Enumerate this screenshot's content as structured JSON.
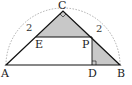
{
  "figure": {
    "points": {
      "A": "A",
      "B": "B",
      "C": "C",
      "D": "D",
      "E": "E",
      "P": "P"
    },
    "side_labels": {
      "AC": "2",
      "BC": "2"
    },
    "colors": {
      "line": "#111111",
      "shade": "#c8c8c8",
      "arc": "#999999",
      "background": "#ffffff"
    },
    "marks": [
      "right-angle-at-C",
      "right-angle-at-D"
    ]
  }
}
